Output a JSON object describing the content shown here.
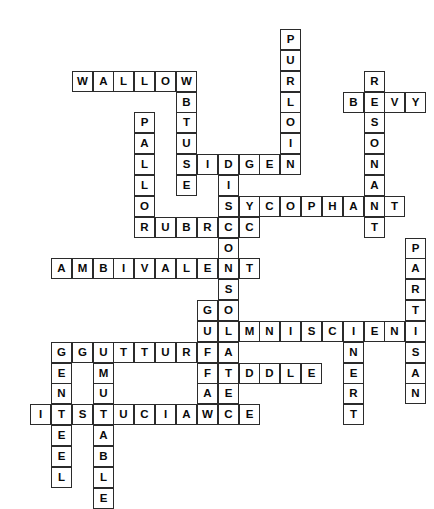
{
  "puzzle": {
    "type": "crossword-grid",
    "title": "Crossword Puzzle Grid",
    "grid": {
      "cell_size": 20.85,
      "origin_x": 30,
      "origin_y": 29,
      "cols": 19,
      "rows": 23,
      "cell_fill": "#ffffff",
      "cell_border": "#2b2b2b",
      "letter_color": "#0a0a0a",
      "background": "#ffffff"
    },
    "entries": [
      {
        "answer": "PURLOIN",
        "direction": "down",
        "row": 0,
        "col": 12,
        "length": 7
      },
      {
        "answer": "RESONANT",
        "direction": "down",
        "row": 2,
        "col": 16,
        "length": 8
      },
      {
        "answer": "WALLOW",
        "direction": "across",
        "row": 2,
        "col": 2,
        "length": 6
      },
      {
        "answer": "OBTUSE",
        "direction": "down",
        "row": 2,
        "col": 7,
        "length": 6
      },
      {
        "answer": "BEVY",
        "direction": "across",
        "row": 3,
        "col": 15,
        "length": 4
      },
      {
        "answer": "PALLOR",
        "direction": "down",
        "row": 4,
        "col": 5,
        "length": 6
      },
      {
        "answer": "MIDGEN",
        "direction": "across",
        "row": 6,
        "col": 7,
        "length": 6
      },
      {
        "answer": "DISCONSOLATE",
        "direction": "down",
        "row": 6,
        "col": 9,
        "length": 12
      },
      {
        "answer": "SYCOPHANT",
        "direction": "across",
        "row": 8,
        "col": 9,
        "length": 9
      },
      {
        "answer": "RUBRIC",
        "direction": "across",
        "row": 9,
        "col": 5,
        "length": 6
      },
      {
        "answer": "PARTISAN",
        "direction": "down",
        "row": 10,
        "col": 18,
        "length": 8
      },
      {
        "answer": "AMBIVALENT",
        "direction": "across",
        "row": 11,
        "col": 1,
        "length": 10
      },
      {
        "answer": "GUFFAW",
        "direction": "down",
        "row": 13,
        "col": 8,
        "length": 6
      },
      {
        "answer": "OMNISCIENT",
        "direction": "across",
        "row": 14,
        "col": 9,
        "length": 10
      },
      {
        "answer": "INERT",
        "direction": "down",
        "row": 14,
        "col": 15,
        "length": 5
      },
      {
        "answer": "GUTTURAL",
        "direction": "across",
        "row": 15,
        "col": 2,
        "length": 8
      },
      {
        "answer": "GENTEEL",
        "direction": "down",
        "row": 15,
        "col": 1,
        "length": 7
      },
      {
        "answer": "ADDLE",
        "direction": "across",
        "row": 16,
        "col": 9,
        "length": 5
      },
      {
        "answer": "MUTABLE",
        "direction": "down",
        "row": 16,
        "col": 3,
        "length": 7
      },
      {
        "answer": "INSOUCIANCE",
        "direction": "across",
        "row": 18,
        "col": 0,
        "length": 11
      }
    ]
  }
}
